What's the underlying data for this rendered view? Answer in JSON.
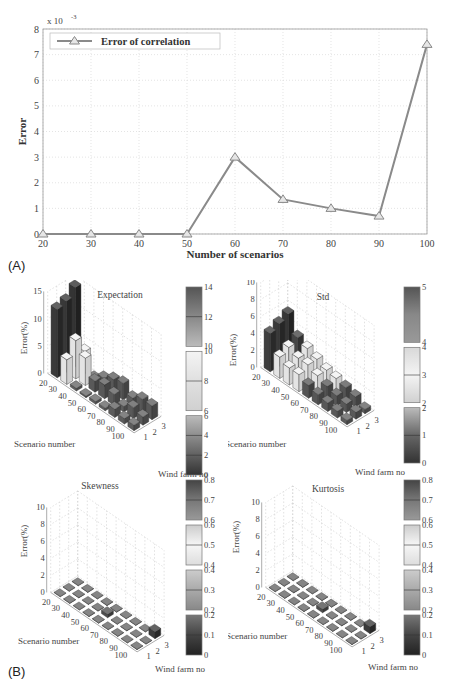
{
  "figure": {
    "panel_a_label": "(A)",
    "panel_b_label": "(B)"
  },
  "chart_data": [
    {
      "id": "A",
      "type": "line",
      "title": "",
      "xlabel": "Number of scenarios",
      "ylabel": "Error",
      "y_multiplier_label": "x 10",
      "y_multiplier_exp": "-3",
      "x": [
        20,
        30,
        40,
        50,
        60,
        70,
        80,
        90,
        100
      ],
      "xticks": [
        20,
        30,
        40,
        50,
        60,
        70,
        80,
        90,
        100
      ],
      "yticks": [
        0,
        1,
        2,
        3,
        4,
        5,
        6,
        7,
        8
      ],
      "xlim": [
        20,
        100
      ],
      "ylim": [
        0,
        8
      ],
      "grid": true,
      "legend_position": "upper left",
      "series": [
        {
          "name": "Error of correlation",
          "marker": "triangle",
          "color": "#8a8a8a",
          "values": [
            0.0,
            0.0,
            0.0,
            0.0,
            3.0,
            1.35,
            1.0,
            0.7,
            7.4
          ]
        }
      ]
    },
    {
      "id": "B1",
      "type": "bar3d",
      "title": "Expectation",
      "xlabel": "Scenario number",
      "ylabel": "Wind farm no",
      "zlabel": "Error(%)",
      "scenarios": [
        20,
        30,
        40,
        50,
        60,
        70,
        80,
        90,
        100
      ],
      "wind_farms": [
        1,
        2,
        3
      ],
      "zticks": [
        0,
        5,
        10,
        15
      ],
      "zlim": [
        0,
        15
      ],
      "values": [
        [
          12.5,
          13.0,
          14.5
        ],
        [
          4.5,
          7.0,
          4.0
        ],
        [
          0.5,
          5.0,
          0.3
        ],
        [
          0.3,
          2.0,
          1.5
        ],
        [
          0.5,
          2.5,
          2.5
        ],
        [
          0.5,
          2.0,
          3.0
        ],
        [
          1.5,
          1.0,
          1.5
        ],
        [
          1.0,
          2.0,
          2.5
        ],
        [
          1.0,
          1.5,
          2.5
        ]
      ],
      "colorbar": [
        {
          "ticks": [
            "14",
            "12",
            "10"
          ]
        },
        {
          "ticks": [
            "10",
            "8",
            "6"
          ]
        },
        {
          "ticks": [
            "6",
            "4",
            "2",
            "0"
          ]
        }
      ]
    },
    {
      "id": "B2",
      "type": "bar3d",
      "title": "Std",
      "xlabel": "Scenario number",
      "ylabel": "Wind farm no",
      "zlabel": "Error(%)",
      "scenarios": [
        20,
        30,
        40,
        50,
        60,
        70,
        80,
        90,
        100
      ],
      "wind_farms": [
        1,
        2,
        3
      ],
      "zticks": [
        0,
        2,
        4,
        6,
        8,
        10
      ],
      "zlim": [
        0,
        10
      ],
      "values": [
        [
          4.5,
          5.0,
          5.5
        ],
        [
          2.5,
          3.0,
          3.5
        ],
        [
          2.0,
          2.5,
          3.0
        ],
        [
          2.0,
          2.5,
          2.5
        ],
        [
          1.5,
          2.0,
          2.0
        ],
        [
          1.2,
          1.5,
          1.8
        ],
        [
          1.0,
          1.2,
          1.5
        ],
        [
          0.8,
          1.0,
          1.2
        ],
        [
          0.5,
          0.8,
          0.5
        ]
      ],
      "colorbar": [
        {
          "ticks": [
            "5",
            "4"
          ]
        },
        {
          "ticks": [
            "4",
            "3",
            "2"
          ]
        },
        {
          "ticks": [
            "2",
            "1",
            "0"
          ]
        }
      ]
    },
    {
      "id": "B3",
      "type": "bar3d",
      "title": "Skewness",
      "xlabel": "Scenario number",
      "ylabel": "Wind farm no",
      "zlabel": "Error(%)",
      "scenarios": [
        20,
        30,
        40,
        50,
        60,
        70,
        80,
        90,
        100
      ],
      "wind_farms": [
        1,
        2,
        3
      ],
      "zticks": [
        0,
        2,
        4,
        6,
        8,
        10
      ],
      "zlim": [
        0,
        10
      ],
      "values": [
        [
          0.05,
          0.05,
          0.05
        ],
        [
          0.05,
          0.05,
          0.05
        ],
        [
          0.05,
          0.05,
          0.05
        ],
        [
          0.05,
          0.05,
          0.05
        ],
        [
          0.05,
          0.4,
          0.05
        ],
        [
          0.05,
          0.05,
          0.05
        ],
        [
          0.05,
          0.05,
          0.05
        ],
        [
          0.05,
          0.05,
          0.05
        ],
        [
          0.05,
          0.05,
          0.8
        ]
      ],
      "colorbar": [
        {
          "ticks": [
            "0.8",
            "0.7",
            "0.6"
          ]
        },
        {
          "ticks": [
            "0.6",
            "0.5",
            "0.4"
          ]
        },
        {
          "ticks": [
            "0.4",
            "0.3",
            "0.2"
          ]
        },
        {
          "ticks": [
            "0.2",
            "0.1",
            "0"
          ]
        }
      ]
    },
    {
      "id": "B4",
      "type": "bar3d",
      "title": "Kurtosis",
      "xlabel": "Scenario number",
      "ylabel": "Wind farm no",
      "zlabel": "Error(%)",
      "scenarios": [
        20,
        30,
        40,
        50,
        60,
        70,
        80,
        90,
        100
      ],
      "wind_farms": [
        1,
        2,
        3
      ],
      "zticks": [
        0,
        2,
        4,
        6,
        8,
        10
      ],
      "zlim": [
        0,
        10
      ],
      "values": [
        [
          0.05,
          0.05,
          0.05
        ],
        [
          0.05,
          0.05,
          0.05
        ],
        [
          0.05,
          0.05,
          0.05
        ],
        [
          0.05,
          0.05,
          0.05
        ],
        [
          0.05,
          0.4,
          0.05
        ],
        [
          0.05,
          0.05,
          0.05
        ],
        [
          0.05,
          0.05,
          0.05
        ],
        [
          0.05,
          0.05,
          0.05
        ],
        [
          0.05,
          0.05,
          0.8
        ]
      ],
      "colorbar": [
        {
          "ticks": [
            "0.8",
            "0.7",
            "0.6"
          ]
        },
        {
          "ticks": [
            "0.6",
            "0.5",
            "0.4"
          ]
        },
        {
          "ticks": [
            "0.4",
            "0.3",
            "0.2"
          ]
        },
        {
          "ticks": [
            "0.2",
            "0.1",
            "0"
          ]
        }
      ]
    }
  ]
}
